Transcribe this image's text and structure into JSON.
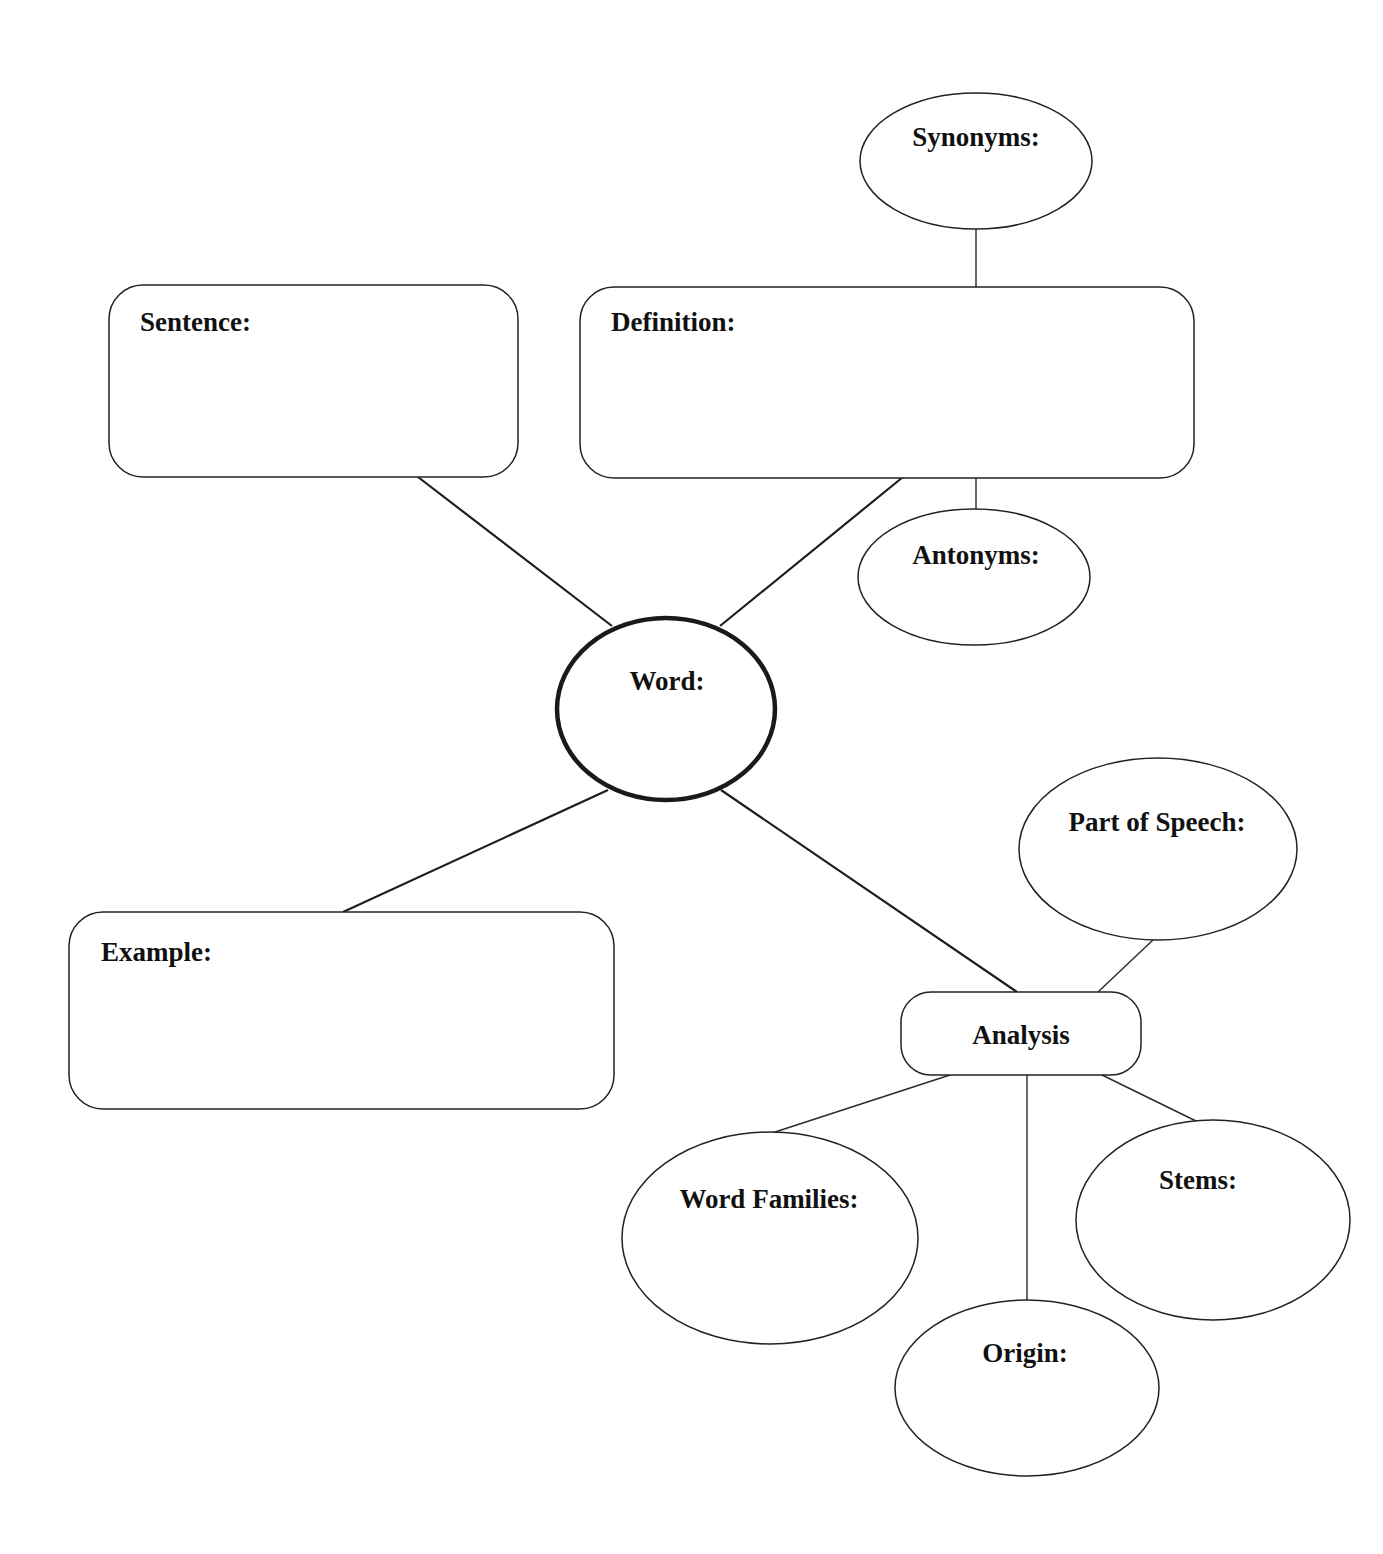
{
  "diagram": {
    "nodes": {
      "word": {
        "label": "Word:",
        "shape": "circle"
      },
      "sentence": {
        "label": "Sentence:",
        "shape": "rounded-rect"
      },
      "definition": {
        "label": "Definition:",
        "shape": "rounded-rect"
      },
      "synonyms": {
        "label": "Synonyms:",
        "shape": "ellipse"
      },
      "antonyms": {
        "label": "Antonyms:",
        "shape": "ellipse"
      },
      "example": {
        "label": "Example:",
        "shape": "rounded-rect"
      },
      "analysis": {
        "label": "Analysis",
        "shape": "rounded-rect"
      },
      "part_of_speech": {
        "label": "Part of Speech:",
        "shape": "ellipse"
      },
      "word_families": {
        "label": "Word Families:",
        "shape": "ellipse"
      },
      "origin": {
        "label": "Origin:",
        "shape": "ellipse"
      },
      "stems": {
        "label": "Stems:",
        "shape": "ellipse"
      }
    },
    "edges": [
      [
        "word",
        "sentence"
      ],
      [
        "word",
        "definition"
      ],
      [
        "definition",
        "synonyms"
      ],
      [
        "definition",
        "antonyms"
      ],
      [
        "word",
        "example"
      ],
      [
        "word",
        "analysis"
      ],
      [
        "analysis",
        "part_of_speech"
      ],
      [
        "analysis",
        "word_families"
      ],
      [
        "analysis",
        "origin"
      ],
      [
        "analysis",
        "stems"
      ]
    ],
    "colors": {
      "stroke": "#1e1e1e",
      "background": "#ffffff",
      "text": "#111111"
    }
  }
}
